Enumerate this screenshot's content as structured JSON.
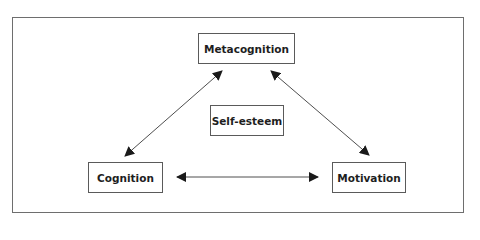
{
  "diagram": {
    "type": "relationship-triangle",
    "nodes": {
      "metacognition": {
        "label": "Metacognition"
      },
      "self_esteem": {
        "label": "Self-esteem"
      },
      "cognition": {
        "label": "Cognition"
      },
      "motivation": {
        "label": "Motivation"
      }
    },
    "edges": [
      {
        "from": "Metacognition",
        "to": "Cognition",
        "direction": "bidirectional"
      },
      {
        "from": "Metacognition",
        "to": "Motivation",
        "direction": "bidirectional"
      },
      {
        "from": "Cognition",
        "to": "Motivation",
        "direction": "bidirectional"
      }
    ],
    "colors": {
      "line": "#3a3a3a",
      "text": "#1e1e1e",
      "border": "#5a5a5a",
      "background": "#ffffff"
    }
  }
}
